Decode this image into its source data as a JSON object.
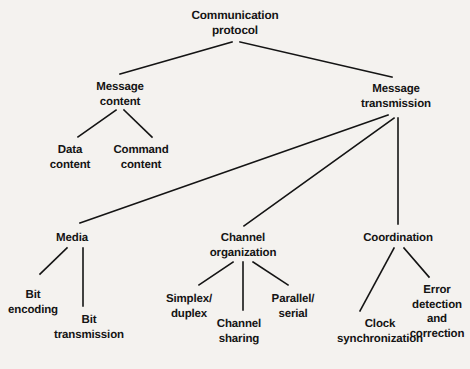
{
  "diagram": {
    "type": "tree",
    "background_color": "#f4f2ef",
    "line_color": "#141414",
    "text_color": "#141414",
    "nodes": [
      {
        "id": "root",
        "label": "Communication\nprotocol",
        "x": 235,
        "y": 8,
        "level": 0
      },
      {
        "id": "msg_content",
        "label": "Message\ncontent",
        "x": 120,
        "y": 80,
        "level": 1
      },
      {
        "id": "msg_transmission",
        "label": "Message\ntransmission",
        "x": 396,
        "y": 82,
        "level": 1
      },
      {
        "id": "data_content",
        "label": "Data\ncontent",
        "x": 70,
        "y": 143,
        "level": 2
      },
      {
        "id": "command_content",
        "label": "Command\ncontent",
        "x": 141,
        "y": 143,
        "level": 2
      },
      {
        "id": "media",
        "label": "Media",
        "x": 72,
        "y": 231,
        "level": 2
      },
      {
        "id": "channel_org",
        "label": "Channel\norganization",
        "x": 243,
        "y": 231,
        "level": 2
      },
      {
        "id": "coordination",
        "label": "Coordination",
        "x": 398,
        "y": 231,
        "level": 2
      },
      {
        "id": "bit_encoding",
        "label": "Bit\nencoding",
        "x": 33,
        "y": 288,
        "level": 3
      },
      {
        "id": "bit_transmission",
        "label": "Bit\ntransmission",
        "x": 89,
        "y": 313,
        "level": 3
      },
      {
        "id": "simplex_duplex",
        "label": "Simplex/\nduplex",
        "x": 189,
        "y": 292,
        "level": 3
      },
      {
        "id": "channel_sharing",
        "label": "Channel\nsharing",
        "x": 239,
        "y": 317,
        "level": 3
      },
      {
        "id": "parallel_serial",
        "label": "Parallel/\nserial",
        "x": 293,
        "y": 292,
        "level": 3
      },
      {
        "id": "clock_sync",
        "label": "Clock\nsynchronization",
        "x": 380,
        "y": 317,
        "level": 3
      },
      {
        "id": "error_detection",
        "label": "Error\ndetection\nand\ncorrection",
        "x": 437,
        "y": 283,
        "level": 3
      }
    ],
    "edges": [
      {
        "from": "root",
        "to": "msg_content",
        "x1": 232,
        "y1": 42,
        "x2": 120,
        "y2": 74
      },
      {
        "from": "root",
        "to": "msg_transmission",
        "x1": 240,
        "y1": 42,
        "x2": 392,
        "y2": 77
      },
      {
        "from": "msg_content",
        "to": "data_content",
        "x1": 116,
        "y1": 110,
        "x2": 78,
        "y2": 137
      },
      {
        "from": "msg_content",
        "to": "command_content",
        "x1": 124,
        "y1": 110,
        "x2": 152,
        "y2": 137
      },
      {
        "from": "msg_transmission",
        "to": "media",
        "x1": 388,
        "y1": 115,
        "x2": 80,
        "y2": 223
      },
      {
        "from": "msg_transmission",
        "to": "channel_org",
        "x1": 394,
        "y1": 118,
        "x2": 244,
        "y2": 226
      },
      {
        "from": "msg_transmission",
        "to": "coordination",
        "x1": 398,
        "y1": 118,
        "x2": 398,
        "y2": 224
      },
      {
        "from": "media",
        "to": "bit_encoding",
        "x1": 67,
        "y1": 248,
        "x2": 40,
        "y2": 274
      },
      {
        "from": "media",
        "to": "bit_transmission",
        "x1": 83,
        "y1": 248,
        "x2": 83,
        "y2": 306
      },
      {
        "from": "channel_org",
        "to": "simplex_duplex",
        "x1": 233,
        "y1": 262,
        "x2": 199,
        "y2": 285
      },
      {
        "from": "channel_org",
        "to": "channel_sharing",
        "x1": 243,
        "y1": 262,
        "x2": 243,
        "y2": 310
      },
      {
        "from": "channel_org",
        "to": "parallel_serial",
        "x1": 253,
        "y1": 262,
        "x2": 288,
        "y2": 285
      },
      {
        "from": "coordination",
        "to": "clock_sync",
        "x1": 394,
        "y1": 248,
        "x2": 360,
        "y2": 311
      },
      {
        "from": "coordination",
        "to": "error_detection",
        "x1": 404,
        "y1": 248,
        "x2": 429,
        "y2": 277
      }
    ]
  }
}
